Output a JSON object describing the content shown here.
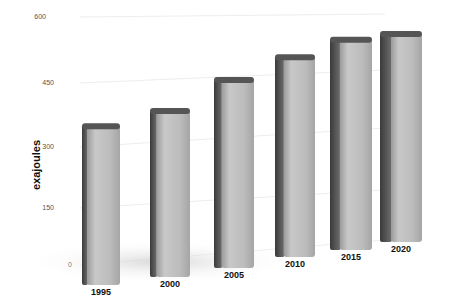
{
  "chart_data": {
    "type": "bar",
    "title": "",
    "xlabel": "",
    "ylabel": "exajoules",
    "categories": [
      "1995",
      "2000",
      "2005",
      "2010",
      "2015",
      "2020"
    ],
    "values": [
      365,
      395,
      460,
      515,
      550,
      560
    ],
    "ylim": [
      0,
      600
    ],
    "yticks": [
      "0",
      "150",
      "300",
      "450",
      "600"
    ],
    "grid": true,
    "legend": "none",
    "style": "3d perspective bars, grey"
  }
}
